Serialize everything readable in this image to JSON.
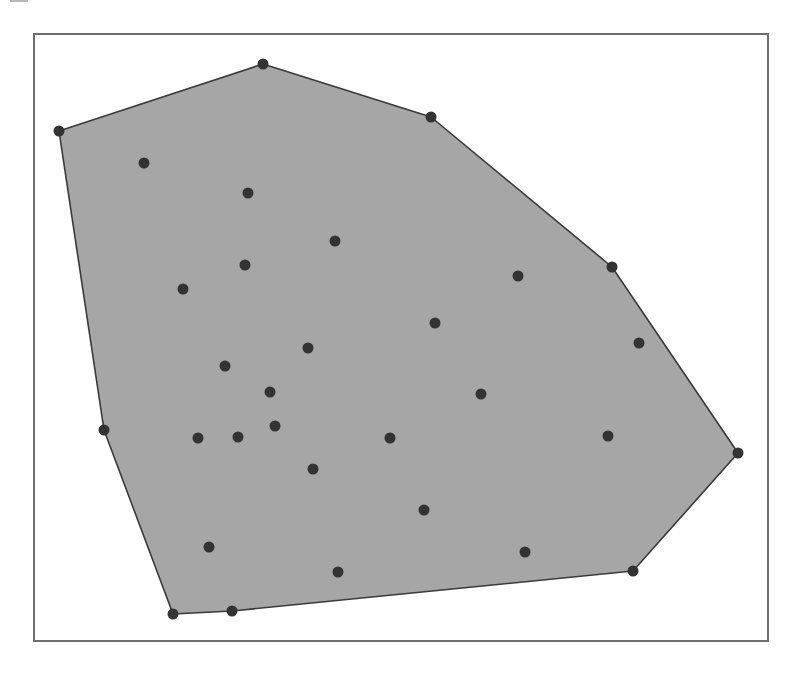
{
  "diagram": {
    "type": "convex-hull",
    "colors": {
      "background": "#ffffff",
      "frame": "#6e6e6e",
      "hull_fill": "#a6a6a6",
      "hull_stroke": "#3a3a3a",
      "point": "#333333"
    },
    "frame": {
      "x": 33,
      "y": 33,
      "width": 736,
      "height": 609
    },
    "hull_vertices": [
      [
        59,
        131
      ],
      [
        263,
        64
      ],
      [
        431,
        117
      ],
      [
        612,
        267
      ],
      [
        738,
        453
      ],
      [
        633,
        571
      ],
      [
        232,
        611
      ],
      [
        173,
        614
      ],
      [
        104,
        430
      ]
    ],
    "interior_points": [
      [
        144,
        163
      ],
      [
        248,
        193
      ],
      [
        335,
        241
      ],
      [
        245,
        265
      ],
      [
        183,
        289
      ],
      [
        518,
        276
      ],
      [
        435,
        323
      ],
      [
        308,
        348
      ],
      [
        639,
        343
      ],
      [
        225,
        366
      ],
      [
        270,
        392
      ],
      [
        481,
        394
      ],
      [
        198,
        438
      ],
      [
        238,
        437
      ],
      [
        275,
        426
      ],
      [
        390,
        438
      ],
      [
        608,
        436
      ],
      [
        313,
        469
      ],
      [
        424,
        510
      ],
      [
        209,
        547
      ],
      [
        525,
        552
      ],
      [
        338,
        572
      ]
    ],
    "point_radius": 5.5
  }
}
